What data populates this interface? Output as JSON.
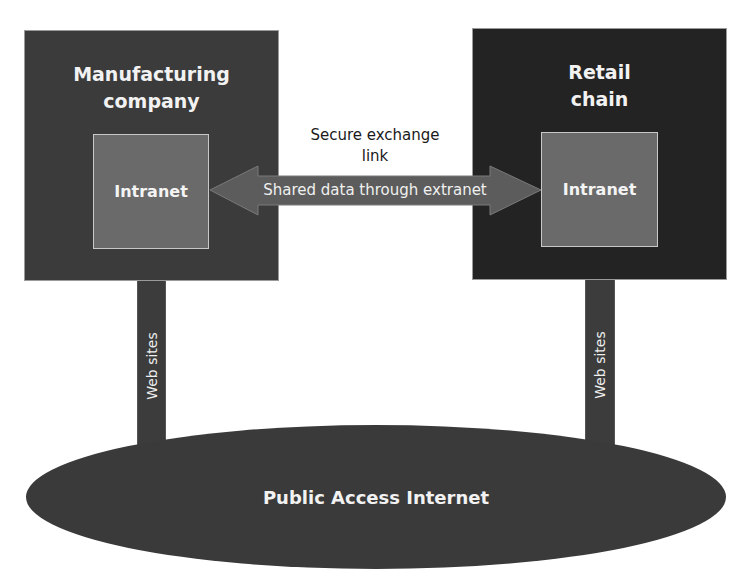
{
  "diagram": {
    "nodes": {
      "manufacturing": {
        "title_line1": "Manufacturing",
        "title_line2": "company",
        "intranet_label": "Intranet"
      },
      "retail": {
        "title_line1": "Retail",
        "title_line2": "chain",
        "intranet_label": "Intranet"
      },
      "internet": {
        "label": "Public Access Internet"
      }
    },
    "links": {
      "secure_exchange": {
        "label_line1": "Secure exchange",
        "label_line2": "link",
        "arrow_label": "Shared data through extranet",
        "direction": "bidirectional"
      },
      "web_sites_left": {
        "label": "Web sites"
      },
      "web_sites_right": {
        "label": "Web sites"
      }
    },
    "colors": {
      "manufacturing_box": "#3b3b3b",
      "retail_box": "#232323",
      "intranet_box": "#6a6a6a",
      "arrow": "#5c5c5c",
      "internet_ellipse": "#3a3a3a"
    }
  }
}
